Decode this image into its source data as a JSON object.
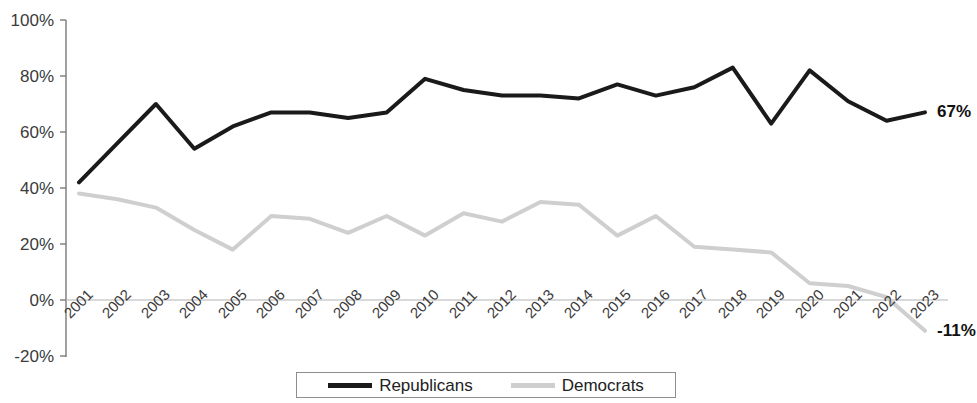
{
  "chart_data": {
    "type": "line",
    "title": "",
    "subtitle": "",
    "xlabel": "",
    "ylabel": "",
    "grid": false,
    "legend_position": "bottom",
    "xlim": [
      "2001",
      "2023"
    ],
    "ylim": [
      -20,
      100
    ],
    "y_ticks": [
      "100%",
      "80%",
      "60%",
      "40%",
      "20%",
      "0%",
      "-20%"
    ],
    "y_tick_values": [
      100,
      80,
      60,
      40,
      20,
      0,
      -20
    ],
    "categories": [
      "2001",
      "2002",
      "2003",
      "2004",
      "2005",
      "2006",
      "2007",
      "2008",
      "2009",
      "2010",
      "2011",
      "2012",
      "2013",
      "2014",
      "2015",
      "2016",
      "2017",
      "2018",
      "2019",
      "2020",
      "2021",
      "2022",
      "2023"
    ],
    "series": [
      {
        "name": "Republicans",
        "color": "#1a1a1a",
        "line_width": 4,
        "dash": "solid",
        "values": [
          42,
          56,
          70,
          54,
          62,
          67,
          67,
          65,
          67,
          79,
          75,
          73,
          73,
          72,
          77,
          73,
          76,
          83,
          63,
          82,
          71,
          64,
          67
        ],
        "end_label": "67%"
      },
      {
        "name": "Democrats",
        "color": "#cfcfcf",
        "line_width": 4,
        "dash": "solid",
        "values": [
          38,
          36,
          33,
          25,
          18,
          30,
          29,
          24,
          30,
          23,
          31,
          28,
          35,
          34,
          23,
          30,
          19,
          18,
          17,
          6,
          5,
          1,
          -11
        ],
        "end_label": "-11%"
      }
    ],
    "annotations": [
      {
        "text": "67%",
        "series": "Republicans",
        "at": "2023"
      },
      {
        "text": "-11%",
        "series": "Democrats",
        "at": "2023"
      }
    ]
  },
  "legend": {
    "entries": [
      {
        "label": "Republicans",
        "color": "#1a1a1a"
      },
      {
        "label": "Democrats",
        "color": "#cfcfcf"
      }
    ]
  },
  "axis": {
    "zero_line_color": "#b4b4b4",
    "axis_line_color": "#7a7a7a"
  }
}
